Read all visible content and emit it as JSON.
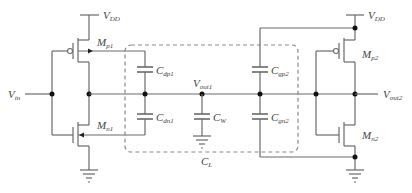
{
  "diagram": {
    "type": "circuit-schematic",
    "labels": {
      "vdd_left": {
        "main": "V",
        "sub": "DD"
      },
      "vdd_right": {
        "main": "V",
        "sub": "DD"
      },
      "vin": {
        "main": "V",
        "sub": "in"
      },
      "vout1": {
        "main": "V",
        "sub": "out1"
      },
      "vout2": {
        "main": "V",
        "sub": "out2"
      },
      "mp1": {
        "main": "M",
        "sub": "p1"
      },
      "mn1": {
        "main": "M",
        "sub": "n1"
      },
      "mp2": {
        "main": "M",
        "sub": "p2"
      },
      "mn2": {
        "main": "M",
        "sub": "n2"
      },
      "cdp1": {
        "main": "C",
        "sub": "dp1"
      },
      "cdn1": {
        "main": "C",
        "sub": "dn1"
      },
      "cw": {
        "main": "C",
        "sub": "W"
      },
      "cgp2": {
        "main": "C",
        "sub": "gp2"
      },
      "cgn2": {
        "main": "C",
        "sub": "gn2"
      },
      "cl": {
        "main": "C",
        "sub": "L"
      }
    },
    "colors": {
      "wire": "#6a6a6a",
      "node": "#111111",
      "dashed_box": "#8a8a8a",
      "text": "#444444"
    }
  }
}
